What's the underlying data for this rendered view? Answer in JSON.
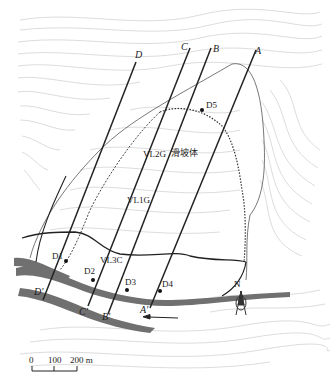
{
  "map": {
    "title": "Landslide topographic map with section lines",
    "landslide_label": "滑坡体",
    "colors": {
      "contour": "#b8b8b8",
      "river": "#6e6e6e",
      "line": "#222222",
      "background": "#ffffff"
    },
    "section_lines": [
      {
        "start": "A",
        "end": "A'"
      },
      {
        "start": "B",
        "end": "B'"
      },
      {
        "start": "C",
        "end": "C'"
      },
      {
        "start": "D",
        "end": "D'"
      }
    ],
    "labels": {
      "A": "A",
      "A_prime": "A'",
      "B": "B",
      "B_prime": "B'",
      "C": "C",
      "C_prime": "C'",
      "D": "D",
      "D_prime": "D'"
    },
    "points": {
      "D1": "D1",
      "D2": "D2",
      "D3": "D3",
      "D4": "D4",
      "D5": "D5"
    },
    "boreholes": {
      "VL1G": "VL1G",
      "VL2G": "VL2G",
      "VL3C": "VL3C"
    },
    "north_arrow": "N",
    "scale_bar": {
      "ticks": [
        "0",
        "100",
        "200 m"
      ]
    }
  }
}
